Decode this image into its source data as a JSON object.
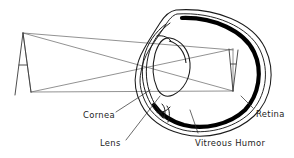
{
  "figure": {
    "background_color": "#ffffff",
    "ink_color": "#1b1b1b",
    "ray_color": "#6e6e6e"
  },
  "labels": {
    "cornea": "Cornea",
    "lens": "Lens",
    "vitreous_humor": "Vitreous Humor",
    "retina": "Retina"
  },
  "structures": {
    "object_letter": "A",
    "image_letter": "A",
    "sclera": "sclera-outline",
    "choroid": "choroid-outline",
    "retina_arc": "retina-arc",
    "cornea_shape": "cornea-bulge",
    "lens_shape": "lens-ellipse",
    "iris": "iris-stops"
  },
  "icons": {
    "object_arrow": "object-letter-a-icon",
    "image_arrow": "inverted-image-letter-a-icon"
  },
  "optics": {
    "object_apex_x": 23,
    "object_apex_y": 33,
    "object_base_y": 92,
    "image_top_y": 48,
    "image_bottom_y": 92,
    "crossing_x": 155,
    "crossing_y": 63
  }
}
